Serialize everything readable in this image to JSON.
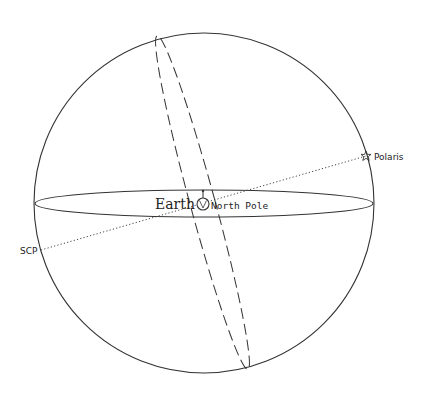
{
  "diagram": {
    "type": "celestial-sphere",
    "colors": {
      "background": "#ffffff",
      "stroke": "#333333",
      "text": "#222222"
    },
    "sphere": {
      "cx": 204,
      "cy": 203,
      "r": 170
    },
    "celestial_equator": {
      "cx": 204,
      "cy": 203.5,
      "rx": 169,
      "ry": 13.5
    },
    "meridian": {
      "cx": 202.5,
      "cy": 202.5,
      "rx": 13,
      "ry": 173,
      "rotate_deg": -15.2,
      "style": "dashed"
    },
    "axis": {
      "x1": 41,
      "y1": 250,
      "x2": 366,
      "y2": 156,
      "style": "dotted"
    },
    "labels": {
      "earth": "Earth",
      "north_pole": "North Pole",
      "polaris": "Polaris",
      "scp": "SCP"
    },
    "icons": {
      "earth": "earth-globe-icon",
      "polaris": "star-icon"
    }
  }
}
